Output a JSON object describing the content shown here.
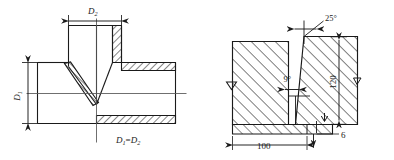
{
  "drawing": {
    "title": "Welded joint cross-section details",
    "stroke_color": "#1a1a1a",
    "hatch_color": "#2b2b2b",
    "background_color": "#ffffff"
  },
  "figures": [
    {
      "id": "tee-joint",
      "name": "tee-pipe-welded-joint",
      "description": "Cross-section of a tee (T) pipe branch weld joint",
      "labels": {
        "branch_diameter": "D",
        "branch_diameter_sub": "2",
        "run_diameter": "D",
        "run_diameter_sub": "1",
        "relation": "D₁= D₂",
        "relation_main_1": "D",
        "relation_sub_1": "1",
        "relation_eq": "=",
        "relation_main_2": "D",
        "relation_sub_2": "2"
      }
    },
    {
      "id": "butt-joint",
      "name": "bevelled-butt-weld-groove",
      "description": "Cross-section of a bevelled butt weld groove with backing strip",
      "labels": {
        "bevel_angle": "25°",
        "root_angle": "9°",
        "plate_thickness": "120",
        "backing_width": "100",
        "backing_thickness": "6"
      }
    }
  ],
  "dimensions": {
    "bevel_angle_deg": 25,
    "root_angle_deg": 9,
    "plate_height_mm": 120,
    "backing_strip_width_mm": 100,
    "backing_strip_thickness_mm": 6
  }
}
